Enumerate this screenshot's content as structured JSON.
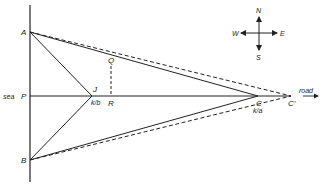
{
  "diagram": {
    "points": {
      "A": {
        "label": "A",
        "x": 30,
        "y": 32
      },
      "B": {
        "label": "B",
        "x": 30,
        "y": 160
      },
      "P": {
        "label": "P",
        "x": 30,
        "y": 96
      },
      "J": {
        "label": "J",
        "x": 92,
        "y": 96
      },
      "Q": {
        "label": "Q",
        "x": 111,
        "y": 62
      },
      "R": {
        "label": "R",
        "x": 111,
        "y": 96
      },
      "C": {
        "label": "C",
        "x": 258,
        "y": 96
      },
      "C_prime": {
        "label": "C'",
        "x": 291,
        "y": 96
      }
    },
    "labels": {
      "sea": "sea",
      "road": "road",
      "speed_J": "k/b",
      "speed_C": "k/a"
    },
    "compass": {
      "north": "N",
      "south": "S",
      "east": "E",
      "west": "W"
    },
    "colors": {
      "ink": "#222222",
      "background": "#ffffff"
    }
  }
}
